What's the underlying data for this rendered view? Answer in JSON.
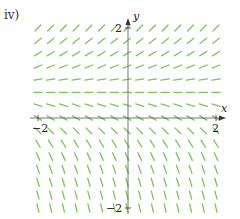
{
  "panel_label": "iv)",
  "axes": {
    "x_name": "x",
    "y_name": "y",
    "x_ticks": [
      {
        "value": -2,
        "label": "−2"
      },
      {
        "value": 2,
        "label": "2"
      }
    ],
    "y_ticks": [
      {
        "value": 2,
        "label": "2"
      },
      {
        "value": -2,
        "label": "−2"
      }
    ],
    "xlim": [
      -2,
      2
    ],
    "ylim": [
      -2,
      2
    ]
  },
  "slope_field": {
    "description": "dy/dx depends on y only; positive slopes above y≈0.7, zero near y≈0.7, increasingly negative (near vertical) below",
    "columns": 15,
    "rows": 15,
    "segment_color": "#7dc35a",
    "axis_color": "#555555"
  },
  "chart_data": {
    "type": "slope_field",
    "title": "iv)",
    "xlabel": "x",
    "ylabel": "y",
    "xlim": [
      -2,
      2
    ],
    "ylim": [
      -2,
      2
    ],
    "grid": false,
    "x_tick_labels": [
      "-2",
      "2"
    ],
    "y_tick_labels": [
      "2",
      "-2"
    ],
    "row_slopes_top_to_bottom": [
      1.0,
      0.8,
      0.6,
      0.4,
      0.15,
      0.0,
      -0.3,
      -0.6,
      -1.0,
      -1.6,
      -2.2,
      -2.8,
      -3.3,
      -3.8,
      -4.2
    ]
  }
}
